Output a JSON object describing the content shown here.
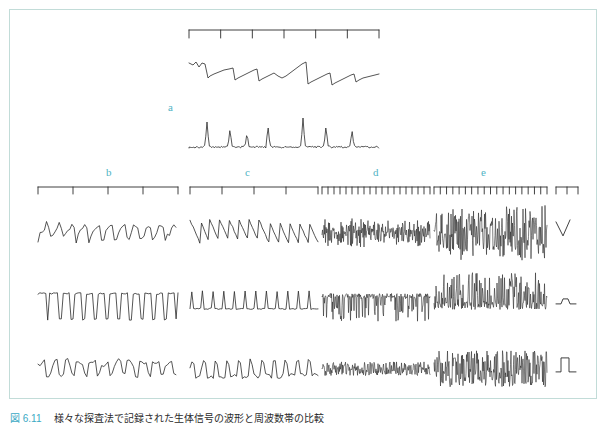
{
  "figure": {
    "border_color": "#c2dcd8",
    "label_color": "#4fb3c4",
    "trace_color": "#2a2a2a",
    "background": "#ffffff"
  },
  "panels": [
    {
      "id": "a",
      "label": "a",
      "label_x": 168,
      "label_y": 101
    },
    {
      "id": "b",
      "label": "b",
      "label_x": 106,
      "label_y": 166
    },
    {
      "id": "c",
      "label": "c",
      "label_x": 245,
      "label_y": 166
    },
    {
      "id": "d",
      "label": "d",
      "label_x": 373,
      "label_y": 166
    },
    {
      "id": "e",
      "label": "e",
      "label_x": 481,
      "label_y": 166
    }
  ],
  "caption": {
    "tag": "図 6.11",
    "text": "様々な探査法で記録された生体信号の波形と周波数帯の比較"
  },
  "scalebars": {
    "top": {
      "x": 189,
      "y": 30,
      "width": 190,
      "ticks": 7,
      "tick_len": 8
    },
    "row": [
      {
        "panel": "b",
        "x": 38,
        "y": 187,
        "width": 140,
        "ticks": 5,
        "tick_len": 7
      },
      {
        "panel": "c",
        "x": 190,
        "y": 187,
        "width": 128,
        "ticks": 5,
        "tick_len": 7
      },
      {
        "panel": "d",
        "x": 322,
        "y": 187,
        "width": 108,
        "ticks": 19,
        "tick_len": 7
      },
      {
        "panel": "e",
        "x": 434,
        "y": 187,
        "width": 113,
        "ticks": 19,
        "tick_len": 7
      },
      {
        "panel": "cal",
        "x": 556,
        "y": 187,
        "width": 22,
        "ticks": 3,
        "tick_len": 7
      }
    ]
  },
  "chart_data": {
    "type": "line",
    "title": "",
    "xlabel": "",
    "ylabel": "",
    "grid": false,
    "legend": "none",
    "traces": [
      {
        "name": "a-top",
        "panel": "a",
        "x": 189,
        "y": 55,
        "w": 190,
        "h": 34,
        "waveform": "sawtooth-ramp",
        "points": [
          [
            0,
            26
          ],
          [
            4,
            24
          ],
          [
            7,
            27
          ],
          [
            10,
            22
          ],
          [
            13,
            26
          ],
          [
            16,
            25
          ],
          [
            19,
            11
          ],
          [
            21,
            13
          ],
          [
            25,
            15
          ],
          [
            30,
            17
          ],
          [
            35,
            19
          ],
          [
            40,
            20
          ],
          [
            44,
            21
          ],
          [
            46,
            9
          ],
          [
            49,
            11
          ],
          [
            53,
            13
          ],
          [
            57,
            15
          ],
          [
            61,
            17
          ],
          [
            65,
            19
          ],
          [
            68,
            20
          ],
          [
            70,
            8
          ],
          [
            73,
            10
          ],
          [
            77,
            12
          ],
          [
            81,
            14
          ],
          [
            85,
            16
          ],
          [
            89,
            13
          ],
          [
            93,
            11
          ],
          [
            97,
            13
          ],
          [
            101,
            16
          ],
          [
            105,
            19
          ],
          [
            109,
            22
          ],
          [
            113,
            25
          ],
          [
            117,
            27
          ],
          [
            119,
            5
          ],
          [
            122,
            7
          ],
          [
            126,
            9
          ],
          [
            130,
            11
          ],
          [
            134,
            13
          ],
          [
            138,
            15
          ],
          [
            141,
            16
          ],
          [
            143,
            4
          ],
          [
            146,
            6
          ],
          [
            150,
            8
          ],
          [
            154,
            10
          ],
          [
            158,
            12
          ],
          [
            162,
            14
          ],
          [
            165,
            15
          ],
          [
            167,
            7
          ],
          [
            170,
            9
          ],
          [
            174,
            11
          ],
          [
            178,
            12
          ],
          [
            182,
            13
          ],
          [
            186,
            14
          ],
          [
            190,
            15
          ]
        ]
      },
      {
        "name": "a-bottom",
        "panel": "a",
        "x": 189,
        "y": 118,
        "w": 190,
        "h": 34,
        "waveform": "spike-train",
        "spike_positions": [
          18,
          41,
          58,
          79,
          114,
          137,
          163
        ],
        "spike_amplitudes": [
          26,
          19,
          15,
          22,
          30,
          22,
          18
        ]
      },
      {
        "name": "b-1",
        "panel": "b",
        "row": 1,
        "x": 38,
        "y": 208,
        "w": 140,
        "h": 45,
        "waveform": "irregular-sawtooth-oscillation",
        "cycles": 11,
        "amplitude": 0.75,
        "noise": 0.22
      },
      {
        "name": "b-2",
        "panel": "b",
        "row": 2,
        "x": 38,
        "y": 276,
        "w": 140,
        "h": 45,
        "waveform": "square-with-downward-spikes",
        "cycles": 12,
        "amplitude": 0.85,
        "noise": 0.1
      },
      {
        "name": "b-3",
        "panel": "b",
        "row": 3,
        "x": 38,
        "y": 344,
        "w": 140,
        "h": 45,
        "waveform": "plateau-bursts",
        "cycles": 11,
        "amplitude": 0.6,
        "noise": 0.3
      },
      {
        "name": "c-1",
        "panel": "c",
        "row": 1,
        "x": 190,
        "y": 208,
        "w": 128,
        "h": 45,
        "waveform": "sawtooth-descending",
        "cycles": 13,
        "amplitude": 0.8,
        "noise": 0.12
      },
      {
        "name": "c-2",
        "panel": "c",
        "row": 2,
        "x": 190,
        "y": 276,
        "w": 128,
        "h": 45,
        "waveform": "narrow-upward-spikes",
        "cycles": 12,
        "amplitude": 0.9,
        "noise": 0.08
      },
      {
        "name": "c-3",
        "panel": "c",
        "row": 3,
        "x": 190,
        "y": 344,
        "w": 128,
        "h": 45,
        "waveform": "rounded-bursts",
        "cycles": 11,
        "amplitude": 0.65,
        "noise": 0.25
      },
      {
        "name": "d-1",
        "panel": "d",
        "row": 1,
        "x": 322,
        "y": 208,
        "w": 108,
        "h": 45,
        "waveform": "dense-high-frequency",
        "cycles": 120,
        "amplitude": 0.55,
        "noise": 0.6
      },
      {
        "name": "d-2",
        "panel": "d",
        "row": 2,
        "x": 322,
        "y": 276,
        "w": 108,
        "h": 45,
        "waveform": "dense-downward-spikes",
        "cycles": 130,
        "amplitude": 0.7,
        "noise": 0.5
      },
      {
        "name": "d-3",
        "panel": "d",
        "row": 3,
        "x": 322,
        "y": 344,
        "w": 108,
        "h": 45,
        "waveform": "dense-compressed-band",
        "cycles": 150,
        "amplitude": 0.4,
        "noise": 0.7
      },
      {
        "name": "e-1",
        "panel": "e",
        "row": 1,
        "x": 434,
        "y": 208,
        "w": 113,
        "h": 45,
        "waveform": "very-dense-high-amplitude",
        "cycles": 150,
        "amplitude": 0.9,
        "noise": 0.8
      },
      {
        "name": "e-2",
        "panel": "e",
        "row": 2,
        "x": 434,
        "y": 276,
        "w": 113,
        "h": 45,
        "waveform": "very-dense-upward-spikes",
        "cycles": 160,
        "amplitude": 0.85,
        "noise": 0.7
      },
      {
        "name": "e-3",
        "panel": "e",
        "row": 3,
        "x": 434,
        "y": 344,
        "w": 113,
        "h": 45,
        "waveform": "very-dense-solid-band",
        "cycles": 180,
        "amplitude": 0.8,
        "noise": 0.75
      }
    ],
    "calibration_markers": [
      {
        "name": "cal-row1",
        "shape": "v-notch",
        "x": 556,
        "y": 208,
        "w": 24,
        "h": 45
      },
      {
        "name": "cal-row2",
        "shape": "small-bump",
        "x": 556,
        "y": 276,
        "w": 24,
        "h": 45
      },
      {
        "name": "cal-row3",
        "shape": "square-pulse",
        "x": 556,
        "y": 344,
        "w": 24,
        "h": 45
      }
    ]
  }
}
